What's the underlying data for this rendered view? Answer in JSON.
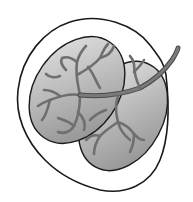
{
  "illustration": {
    "subject": "seed with two cotyledons and veins",
    "colors": {
      "background": "#ffffff",
      "outline": "#1a1a1a",
      "lobe_light": "#e6e6e6",
      "lobe_dark": "#8a8a8a",
      "vein": "#6f6f6f",
      "vein_edge": "#4a4a4a"
    }
  }
}
